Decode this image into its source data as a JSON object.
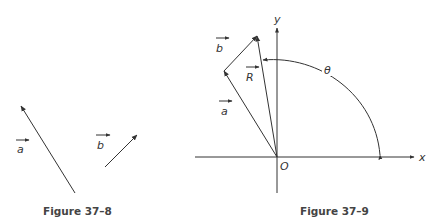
{
  "figures": [
    {
      "caption": "Figure 37–8",
      "vectors": [
        {
          "name": "a",
          "label": "a",
          "from": [
            75,
            193
          ],
          "to": [
            21,
            106
          ]
        },
        {
          "name": "b",
          "label": "b",
          "from": [
            105,
            167
          ],
          "to": [
            137,
            135
          ]
        }
      ]
    },
    {
      "caption": "Figure 37–9",
      "axes": {
        "x_label": "x",
        "y_label": "y",
        "origin_label": "O"
      },
      "vectors": [
        {
          "name": "a",
          "label": "a",
          "from": [
            277,
            157
          ],
          "to": [
            224,
            71
          ]
        },
        {
          "name": "b",
          "label": "b",
          "from": [
            224,
            71
          ],
          "to": [
            257,
            36
          ]
        },
        {
          "name": "R",
          "label": "R",
          "from": [
            277,
            157
          ],
          "to": [
            257,
            36
          ]
        }
      ],
      "angle": {
        "label": "θ"
      }
    }
  ]
}
